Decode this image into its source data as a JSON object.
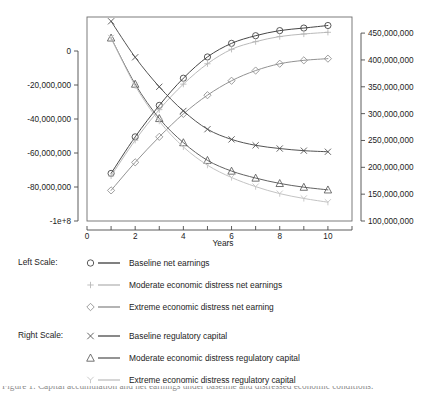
{
  "chart_data": {
    "type": "line",
    "title": "",
    "xlabel": "Years",
    "ylabel_left": "",
    "ylabel_right": "",
    "x": [
      1,
      2,
      3,
      4,
      5,
      6,
      7,
      8,
      9,
      10
    ],
    "xlim": [
      0,
      11
    ],
    "xticks": [
      0,
      2,
      4,
      6,
      8,
      10
    ],
    "xtick_labels": [
      "0",
      "2",
      "4",
      "6",
      "8",
      "10"
    ],
    "left_axis": {
      "lim": [
        -100000000,
        20000000
      ],
      "ticks": [
        0,
        -20000000,
        -40000000,
        -60000000,
        -80000000,
        -100000000
      ],
      "tick_labels": [
        "0",
        "-20,000,000",
        "-40,000,000",
        "-60,000,000",
        "-80,000,000",
        "-1e+8"
      ]
    },
    "right_axis": {
      "lim": [
        100000000,
        480000000
      ],
      "ticks": [
        450000000,
        400000000,
        350000000,
        300000000,
        250000000,
        200000000,
        150000000,
        100000000
      ],
      "tick_labels": [
        "450,000,000",
        "400,000,000",
        "350,000,000",
        "300,000,000",
        "250,000,000",
        "200,000,000",
        "150,000,000",
        "100,000,000"
      ]
    },
    "grid": false,
    "legend_position": "below",
    "series": [
      {
        "name": "Baseline net earnings",
        "axis": "left",
        "marker": "circle",
        "color": "#3c3c3c",
        "values": [
          -72000000,
          -50500000,
          -32000000,
          -16000000,
          -3500000,
          4500000,
          9000000,
          12000000,
          13500000,
          15000000
        ]
      },
      {
        "name": "Moderate economic distress net earnings",
        "axis": "left",
        "marker": "plus",
        "color": "#b5b5b5",
        "values": [
          -73500000,
          -52500000,
          -34500000,
          -19500000,
          -7500000,
          1000000,
          5500000,
          8500000,
          10000000,
          11000000
        ]
      },
      {
        "name": "Extreme economic distress net earning",
        "axis": "left",
        "marker": "diamond",
        "color": "#8c8c8c",
        "values": [
          -82000000,
          -65500000,
          -50500000,
          -37000000,
          -26000000,
          -17500000,
          -11500000,
          -7500000,
          -5500000,
          -4500000
        ]
      },
      {
        "name": "Baseline regulatory capital",
        "axis": "right",
        "marker": "x",
        "color": "#4a4a4a",
        "values": [
          472000000,
          405000000,
          350000000,
          305000000,
          271000000,
          252000000,
          241000000,
          235000000,
          231000000,
          229000000
        ]
      },
      {
        "name": "Moderate economic distress regulatory capital",
        "axis": "right",
        "marker": "triangle",
        "color": "#5a5a5a",
        "values": [
          441000000,
          355000000,
          291000000,
          246000000,
          213000000,
          193000000,
          180000000,
          170000000,
          163000000,
          158000000
        ]
      },
      {
        "name": "Extreme economic distress regulatory capital",
        "axis": "right",
        "marker": "Y",
        "color": "#c0c0c0",
        "values": [
          441000000,
          352000000,
          286000000,
          238000000,
          204000000,
          181000000,
          164000000,
          151000000,
          142000000,
          135000000
        ]
      }
    ]
  },
  "legend": {
    "groups": [
      {
        "label": "Left Scale:",
        "series_indices": [
          0,
          1,
          2
        ]
      },
      {
        "label": "Right Scale:",
        "series_indices": [
          3,
          4,
          5
        ]
      }
    ]
  },
  "caption": {
    "text": "Figure 1. Capital accumulation and net earnings under baseline and distressed economic conditions."
  }
}
